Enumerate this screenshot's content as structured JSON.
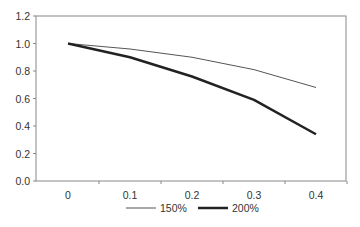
{
  "chart_data": {
    "type": "line",
    "title": "",
    "xlabel": "",
    "ylabel": "",
    "x": [
      0,
      0.1,
      0.2,
      0.3,
      0.4
    ],
    "x_tick_labels": [
      "0",
      "0.1",
      "0.2",
      "0.3",
      "0.4"
    ],
    "y_tick_labels": [
      "0.0",
      "0.2",
      "0.4",
      "0.6",
      "0.8",
      "1.0",
      "1.2"
    ],
    "ylim": [
      0,
      1.2
    ],
    "grid": false,
    "legend_position": "bottom",
    "series": [
      {
        "name": "150%",
        "values": [
          1.0,
          0.96,
          0.9,
          0.81,
          0.68
        ],
        "color": "#555555",
        "width": 1
      },
      {
        "name": "200%",
        "values": [
          1.0,
          0.9,
          0.76,
          0.59,
          0.34
        ],
        "color": "#222222",
        "width": 2.5
      }
    ]
  }
}
